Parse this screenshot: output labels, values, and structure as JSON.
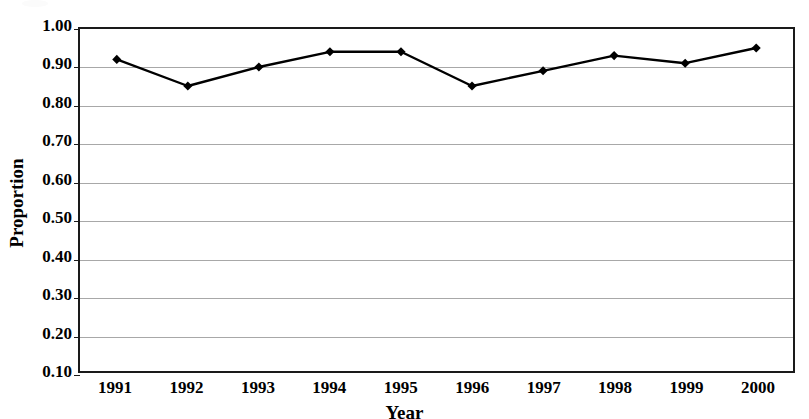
{
  "chart_data": {
    "type": "line",
    "title": "",
    "xlabel": "Year",
    "ylabel": "Proportion",
    "categories": [
      "1991",
      "1992",
      "1993",
      "1994",
      "1995",
      "1996",
      "1997",
      "1998",
      "1999",
      "2000"
    ],
    "values": [
      0.92,
      0.85,
      0.9,
      0.94,
      0.94,
      0.85,
      0.89,
      0.93,
      0.91,
      0.95
    ],
    "series": [
      {
        "name": "Proportion",
        "values": [
          0.92,
          0.85,
          0.9,
          0.94,
          0.94,
          0.85,
          0.89,
          0.93,
          0.91,
          0.95
        ]
      }
    ],
    "ylim": [
      0.1,
      1.0
    ],
    "ytick_step": 0.1,
    "ytick_labels": [
      "1.00",
      "0.90",
      "0.80",
      "0.70",
      "0.60",
      "0.50",
      "0.40",
      "0.30",
      "0.20",
      "0.10"
    ],
    "ytick_values": [
      1.0,
      0.9,
      0.8,
      0.7,
      0.6,
      0.5,
      0.4,
      0.3,
      0.2,
      0.1
    ],
    "grid": true,
    "grid_orientation": "horizontal",
    "legend": false,
    "legend_position": "none",
    "marker": "diamond",
    "line_color": "#000000",
    "marker_color": "#000000",
    "grid_color": "#a8a8a8",
    "frame_color": "#1a1a1a",
    "background_color": "#ffffff"
  },
  "notes": {
    "xlabel_clipped": "Year"
  }
}
